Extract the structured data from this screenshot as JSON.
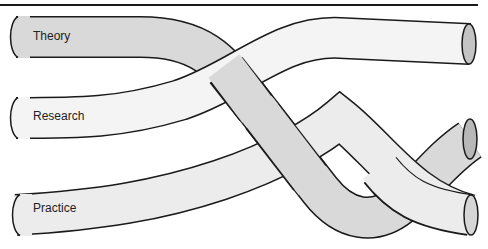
{
  "diagram": {
    "type": "braided-strands",
    "strands": [
      {
        "id": "theory",
        "label": "Theory",
        "fill": "#d9d9d9",
        "cap_fill": "#b8b8b8"
      },
      {
        "id": "research",
        "label": "Research",
        "fill": "#f4f4f4",
        "cap_fill": "#c4c4c4"
      },
      {
        "id": "practice",
        "label": "Practice",
        "fill": "#ececec",
        "cap_fill": "#d6d6d6"
      }
    ],
    "stroke_color": "#1a1a1a"
  }
}
